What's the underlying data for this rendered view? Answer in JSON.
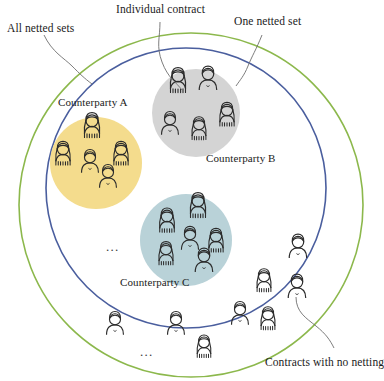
{
  "figure": {
    "type": "venn-style set diagram of netting sets",
    "background": "#ffffff"
  },
  "callouts": [
    {
      "id": "all-netted-sets",
      "text": "All netted sets",
      "x": 7,
      "y": 23
    },
    {
      "id": "individual-contract",
      "text": "Individual contract",
      "x": 116,
      "y": 4
    },
    {
      "id": "one-netted-set",
      "text": "One netted set",
      "x": 234,
      "y": 16
    },
    {
      "id": "contracts-no-netting",
      "text": "Contracts with no netting",
      "x": 265,
      "y": 357
    }
  ],
  "circles": {
    "outer": {
      "name": "All netted sets boundary",
      "color": "#8CB84C",
      "cx": 191,
      "cy": 205,
      "r": 172,
      "stroke_width": 1.6
    },
    "inner": {
      "name": "Netted sets boundary",
      "color": "#4A5E9E",
      "cx": 186,
      "cy": 188,
      "r": 140,
      "stroke_width": 1.6
    }
  },
  "counterparties": [
    {
      "id": "counterparty-a",
      "label": "Counterparty A",
      "fill": "#F4DC8D",
      "cx": 96,
      "cy": 163,
      "r": 46,
      "label_x": 58,
      "label_y": 97,
      "people": [
        {
          "type": "female",
          "x": 92,
          "y": 127,
          "s": 1.0
        },
        {
          "type": "female",
          "x": 63,
          "y": 155,
          "s": 0.95
        },
        {
          "type": "female",
          "x": 121,
          "y": 155,
          "s": 0.95
        },
        {
          "type": "male",
          "x": 90,
          "y": 163,
          "s": 0.92
        },
        {
          "type": "male",
          "x": 108,
          "y": 178,
          "s": 0.92
        }
      ]
    },
    {
      "id": "counterparty-b",
      "label": "Counterparty B",
      "fill": "#D4D4D4",
      "cx": 196,
      "cy": 113,
      "r": 44,
      "label_x": 206,
      "label_y": 153,
      "people": [
        {
          "type": "female",
          "x": 178,
          "y": 82,
          "s": 1.0
        },
        {
          "type": "male",
          "x": 208,
          "y": 80,
          "s": 0.95
        },
        {
          "type": "female",
          "x": 227,
          "y": 116,
          "s": 0.95
        },
        {
          "type": "male",
          "x": 170,
          "y": 125,
          "s": 0.92
        },
        {
          "type": "female",
          "x": 199,
          "y": 130,
          "s": 0.92
        }
      ]
    },
    {
      "id": "counterparty-c",
      "label": "Counterparty C",
      "fill": "#B9D2D8",
      "cx": 186,
      "cy": 240,
      "r": 46,
      "label_x": 120,
      "label_y": 277,
      "people": [
        {
          "type": "female",
          "x": 198,
          "y": 207,
          "s": 1.0
        },
        {
          "type": "female",
          "x": 167,
          "y": 222,
          "s": 0.97
        },
        {
          "type": "male",
          "x": 190,
          "y": 240,
          "s": 0.93
        },
        {
          "type": "female",
          "x": 216,
          "y": 242,
          "s": 0.95
        },
        {
          "type": "female",
          "x": 166,
          "y": 255,
          "s": 0.93
        },
        {
          "type": "male",
          "x": 204,
          "y": 262,
          "s": 0.95
        }
      ]
    }
  ],
  "unnetted_people": [
    {
      "type": "male",
      "x": 298,
      "y": 248,
      "s": 0.95
    },
    {
      "type": "male",
      "x": 297,
      "y": 288,
      "s": 0.95
    },
    {
      "type": "female",
      "x": 264,
      "y": 282,
      "s": 0.92
    },
    {
      "type": "male",
      "x": 240,
      "y": 315,
      "s": 0.92
    },
    {
      "type": "female",
      "x": 268,
      "y": 320,
      "s": 0.92
    },
    {
      "type": "male",
      "x": 115,
      "y": 325,
      "s": 0.92
    },
    {
      "type": "male",
      "x": 176,
      "y": 325,
      "s": 0.92
    },
    {
      "type": "female",
      "x": 204,
      "y": 348,
      "s": 0.9
    }
  ],
  "ellipses": [
    {
      "id": "ellipsis-left",
      "text": "...",
      "x": 106,
      "y": 240
    },
    {
      "id": "ellipsis-bottom",
      "text": "...",
      "x": 140,
      "y": 345
    }
  ],
  "colors": {
    "outer_ring": "#8CB84C",
    "inner_ring": "#4A5E9E",
    "counterparty_a": "#F4DC8D",
    "counterparty_b": "#D4D4D4",
    "counterparty_c": "#B9D2D8",
    "person_stroke": "#2b2b2b",
    "leader_line": "#6e6e6e",
    "text": "#1b1b1b"
  }
}
